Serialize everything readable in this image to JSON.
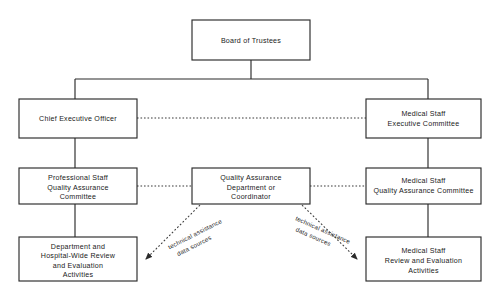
{
  "diagram": {
    "type": "organizational-chart",
    "background_color": "#ffffff",
    "line_color": "#2b2b2b",
    "text_color": "#1a1a1a",
    "nodes": [
      {
        "id": "board",
        "lines": [
          "Board of Trustees"
        ],
        "x": 192,
        "y": 20,
        "w": 118,
        "h": 40
      },
      {
        "id": "ceo",
        "lines": [
          "Chief Executive Officer"
        ],
        "x": 19,
        "y": 99,
        "w": 118,
        "h": 39
      },
      {
        "id": "medical-staff-exec",
        "lines": [
          "Medical Staff",
          "Executive Committee"
        ],
        "x": 366,
        "y": 99,
        "w": 115,
        "h": 39
      },
      {
        "id": "professional-staff-qa",
        "lines": [
          "Professional Staff",
          "Quality Assurance",
          "Committee"
        ],
        "x": 19,
        "y": 168,
        "w": 118,
        "h": 36
      },
      {
        "id": "qa-department",
        "lines": [
          "Quality Assurance",
          "Department or",
          "Coordinator"
        ],
        "x": 192,
        "y": 168,
        "w": 118,
        "h": 36
      },
      {
        "id": "medical-staff-qa",
        "lines": [
          "Medical Staff",
          "Quality Assurance Committee"
        ],
        "x": 366,
        "y": 168,
        "w": 115,
        "h": 36
      },
      {
        "id": "department-hospital-review",
        "lines": [
          "Department and",
          "Hospital-Wide Review",
          "and Evaluation",
          "Activities"
        ],
        "x": 19,
        "y": 237,
        "w": 118,
        "h": 44
      },
      {
        "id": "medical-staff-review",
        "lines": [
          "Medical Staff",
          "Review and Evaluation",
          "Activities"
        ],
        "x": 366,
        "y": 237,
        "w": 115,
        "h": 44
      }
    ],
    "edge_notes": [
      {
        "id": "note-left",
        "lines": [
          "technical assistance",
          "data sources"
        ],
        "x": 196,
        "y": 236,
        "rotate": -27
      },
      {
        "id": "note-right",
        "lines": [
          "technical assistance",
          "data sources"
        ],
        "x": 322,
        "y": 232,
        "rotate": 24
      }
    ]
  }
}
